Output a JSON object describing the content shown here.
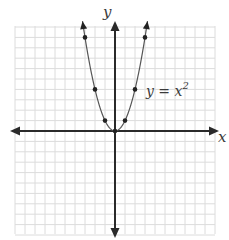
{
  "chart_data": {
    "type": "line",
    "title": "",
    "equation_label": "y = x",
    "equation_exponent": "2",
    "xlabel": "x",
    "ylabel": "y",
    "xlim": [
      -10,
      10
    ],
    "ylim": [
      -10,
      10
    ],
    "grid": true,
    "series": [
      {
        "name": "y = x^2",
        "x": [
          -3,
          -2,
          -1,
          0,
          1,
          2,
          3
        ],
        "y": [
          9,
          4,
          1,
          0,
          1,
          4,
          9
        ],
        "markers": true,
        "arrows_at_ends": true
      }
    ]
  },
  "colors": {
    "axis": "#2a2a2a",
    "grid": "#dcdcdc",
    "curve": "#555555",
    "point": "#222222",
    "text": "#3a3a3a"
  }
}
